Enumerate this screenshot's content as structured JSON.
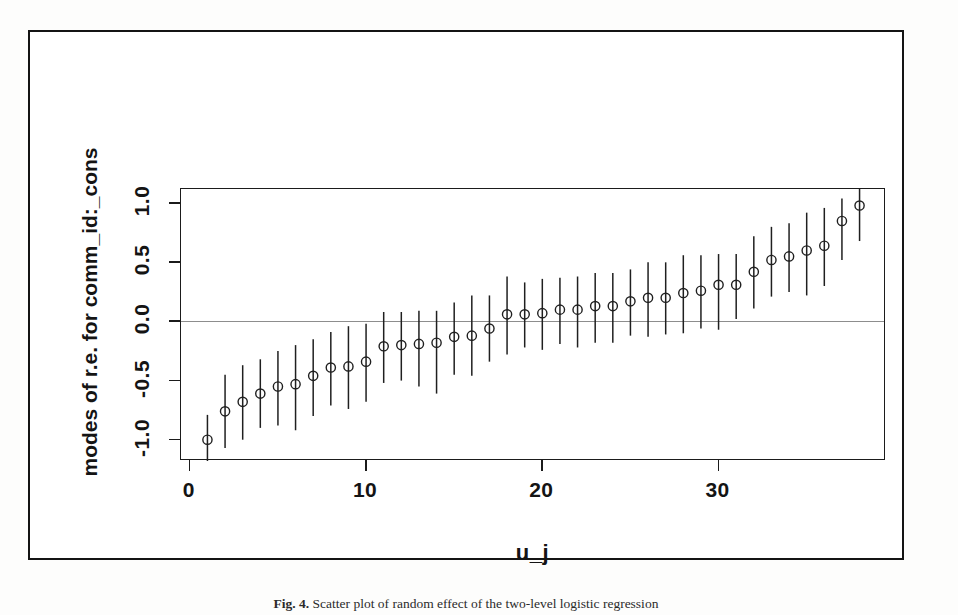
{
  "figure": {
    "caption_label": "Fig. 4.",
    "caption_text": "Scatter plot of random effect of the two-level logistic regression"
  },
  "chart_data": {
    "type": "scatter",
    "title": "",
    "xlabel": "u_j",
    "ylabel": "modes of r.e. for comm_id:_cons",
    "xlim": [
      -0.5,
      39.5
    ],
    "ylim": [
      -1.18,
      1.12
    ],
    "xticks": [
      0,
      10,
      20,
      30
    ],
    "xticklabels": [
      "0",
      "10",
      "20",
      "30"
    ],
    "yticks": [
      -1.0,
      -0.5,
      0.0,
      0.5,
      1.0
    ],
    "yticklabels": [
      "-1.0",
      "-0.5",
      "0.0",
      "0.5",
      "1.0"
    ],
    "grid": false,
    "legend": "none",
    "reference_line_y": 0.0,
    "marker": "open-circle",
    "error_bar_style": "vertical-line",
    "x": [
      1,
      2,
      3,
      4,
      5,
      6,
      7,
      8,
      9,
      10,
      11,
      12,
      13,
      14,
      15,
      16,
      17,
      18,
      19,
      20,
      21,
      22,
      23,
      24,
      25,
      26,
      27,
      28,
      29,
      30,
      31,
      32,
      33,
      34,
      35,
      36,
      37,
      38
    ],
    "values": [
      -1.0,
      -0.76,
      -0.68,
      -0.61,
      -0.55,
      -0.53,
      -0.46,
      -0.39,
      -0.38,
      -0.34,
      -0.21,
      -0.2,
      -0.19,
      -0.18,
      -0.13,
      -0.12,
      -0.06,
      0.06,
      0.06,
      0.07,
      0.1,
      0.1,
      0.13,
      0.13,
      0.17,
      0.2,
      0.2,
      0.24,
      0.26,
      0.31,
      0.31,
      0.42,
      0.52,
      0.55,
      0.6,
      0.64,
      0.85,
      0.98
    ],
    "lower": [
      -1.18,
      -1.07,
      -1.0,
      -0.9,
      -0.88,
      -0.92,
      -0.8,
      -0.71,
      -0.74,
      -0.68,
      -0.52,
      -0.5,
      -0.55,
      -0.61,
      -0.45,
      -0.46,
      -0.34,
      -0.28,
      -0.22,
      -0.24,
      -0.19,
      -0.22,
      -0.18,
      -0.18,
      -0.12,
      -0.13,
      -0.11,
      -0.1,
      -0.06,
      -0.07,
      0.02,
      0.11,
      0.21,
      0.25,
      0.22,
      0.3,
      0.52,
      0.68
    ],
    "upper": [
      -0.79,
      -0.45,
      -0.37,
      -0.32,
      -0.25,
      -0.2,
      -0.15,
      -0.09,
      -0.04,
      -0.02,
      0.08,
      0.08,
      0.09,
      0.09,
      0.16,
      0.22,
      0.22,
      0.38,
      0.33,
      0.36,
      0.37,
      0.38,
      0.41,
      0.41,
      0.44,
      0.5,
      0.5,
      0.56,
      0.56,
      0.57,
      0.57,
      0.72,
      0.8,
      0.83,
      0.92,
      0.96,
      1.04,
      1.12
    ],
    "series_name": "modes of random effects with 95% CI"
  }
}
